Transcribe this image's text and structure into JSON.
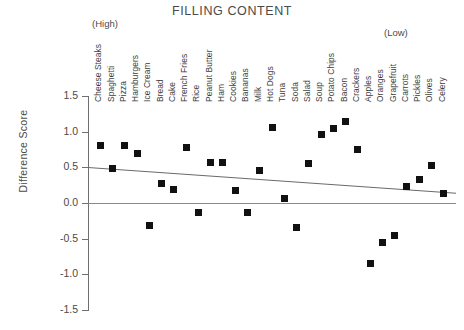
{
  "chart_data": {
    "type": "scatter",
    "title": "FILLING CONTENT",
    "xlabel": "",
    "ylabel": "Difference Score",
    "ylim": [
      -1.5,
      1.5
    ],
    "yticks": [
      "1.5",
      "1.0",
      "0.5",
      "0.0",
      "-0.5",
      "-1.0",
      "-1.5"
    ],
    "ytick_values": [
      1.5,
      1.0,
      0.5,
      0.0,
      -0.5,
      -1.0,
      -1.5
    ],
    "grid": false,
    "legend": null,
    "axis_annotations": {
      "left_end": "(High)",
      "right_end": "(Low)"
    },
    "reference_line": {
      "y": 0.0,
      "style": "solid"
    },
    "trend_line": {
      "y_start": 0.5,
      "y_end": 0.14,
      "style": "solid"
    },
    "categories": [
      "Cheese Steaks",
      "Spaghetti",
      "Pizza",
      "Hamburgers",
      "Ice Cream",
      "Bread",
      "Cake",
      "French Fries",
      "Rice",
      "Peanut Butter",
      "Ham",
      "Cookies",
      "Bananas",
      "Milk",
      "Hot Dogs",
      "Tuna",
      "Soda",
      "Salad",
      "Soup",
      "Potato Chips",
      "Bacon",
      "Crackers",
      "Apples",
      "Oranges",
      "Grapefruit",
      "Carrots",
      "Pickles",
      "Olives",
      "Celery"
    ],
    "values": [
      0.8,
      0.49,
      0.8,
      0.7,
      -0.32,
      0.28,
      0.19,
      0.78,
      -0.13,
      0.57,
      0.57,
      0.17,
      -0.14,
      0.46,
      1.06,
      0.06,
      -0.34,
      0.55,
      0.96,
      1.05,
      1.14,
      0.75,
      -0.85,
      -0.55,
      -0.45,
      0.23,
      0.33,
      0.53,
      0.14
    ],
    "marker": {
      "shape": "square",
      "color": "#111111",
      "size": 7
    }
  }
}
